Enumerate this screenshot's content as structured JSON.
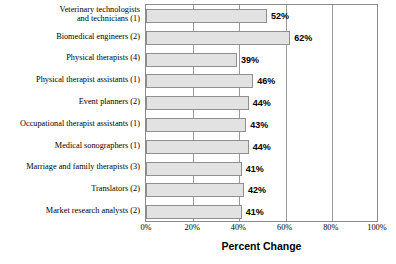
{
  "chart_data": {
    "type": "bar",
    "orientation": "horizontal",
    "title": "",
    "xlabel": "Percent Change",
    "ylabel": "",
    "xlim": [
      0,
      100
    ],
    "xticks": [
      "0%",
      "20%",
      "40%",
      "60%",
      "80%",
      "100%"
    ],
    "xtick_values": [
      0,
      20,
      40,
      60,
      80,
      100
    ],
    "grid": true,
    "legend": "none",
    "value_suffix": "%",
    "categories": [
      "Veterinary technologists\nand technicians (1)",
      "Biomedical engineers (2)",
      "Physical therapists (4)",
      "Physical therapist assistants (1)",
      "Event planners (2)",
      "Occupational therapist assistants (1)",
      "Medical sonographers (1)",
      "Marriage and family therapists (3)",
      "Translators (2)",
      "Market research analysts (2)"
    ],
    "values": [
      52,
      62,
      39,
      46,
      44,
      43,
      44,
      41,
      42,
      41
    ],
    "value_labels": [
      "52%",
      "62%",
      "39%",
      "46%",
      "44%",
      "43%",
      "44%",
      "41%",
      "42%",
      "41%"
    ],
    "colors": {
      "bar_fill": "#e2e2e2",
      "bar_border": "#8f8f8f",
      "gridline": "#9a9a9a",
      "plot_border": "#8a8a8a",
      "text": "#000000",
      "background": "#ffffff"
    }
  }
}
